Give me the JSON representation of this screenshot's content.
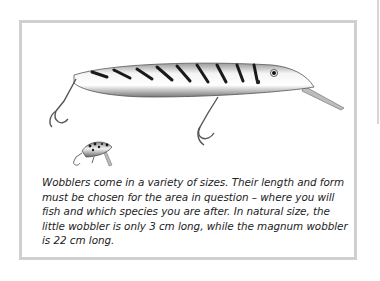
{
  "figure": {
    "caption": "Wobblers come in a variety of sizes. Their length and form must be chosen for the area in question – where you will fish and which species you are after. In natural size, the little wobbler is only 3 cm long, while the magnum wobbler is 22 cm long.",
    "illustrations": [
      {
        "name": "magnum-wobbler",
        "size_cm": 22
      },
      {
        "name": "little-wobbler",
        "size_cm": 3
      }
    ]
  }
}
